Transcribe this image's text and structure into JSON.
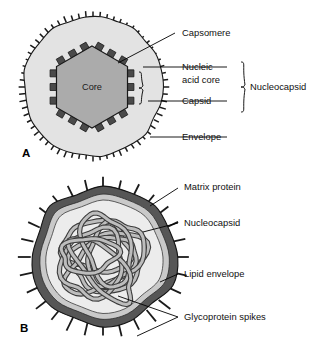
{
  "figure": {
    "panels": [
      {
        "letter": "A",
        "name": "icosahedral-enveloped-virus",
        "core_label": "Core",
        "labels": [
          {
            "key": "capsomere",
            "text": "Capsomere"
          },
          {
            "key": "nucleic_acid_core_line1",
            "text": "Nucleic"
          },
          {
            "key": "nucleic_acid_core_line2",
            "text": "acid core"
          },
          {
            "key": "capsid",
            "text": "Capsid"
          },
          {
            "key": "nucleocapsid",
            "text": "Nucleocapsid"
          },
          {
            "key": "envelope",
            "text": "Envelope"
          }
        ]
      },
      {
        "letter": "B",
        "name": "helical-enveloped-virus",
        "labels": [
          {
            "key": "matrix_protein",
            "text": "Matrix protein"
          },
          {
            "key": "nucleocapsid",
            "text": "Nucleocapsid"
          },
          {
            "key": "lipid_envelope",
            "text": "Lipid envelope"
          },
          {
            "key": "glycoprotein_spikes",
            "text": "Glycoprotein spikes"
          }
        ]
      }
    ]
  },
  "colors": {
    "envelope_fill": "#e3e3e3",
    "core_fill": "#ababab",
    "capsomere_fill": "#4a4a4a",
    "outline": "#1a1a1a",
    "b_outer_band": "#565656",
    "b_mid_band": "#c9c9c9",
    "b_inner_fill": "#ececec",
    "filament_fill": "#bdbdbd",
    "filament_stroke": "#3c3c3c",
    "background": "#ffffff",
    "text": "#111111"
  },
  "panelA": {
    "envelope_center": {
      "x": 93,
      "y": 87
    },
    "envelope_radius": 69,
    "spike_count": 64,
    "hexagon_center": {
      "x": 92,
      "y": 87
    },
    "hexagon_radius": 41,
    "capsomere_count": 18
  },
  "panelB": {
    "center": {
      "x": 103,
      "y": 257
    },
    "radius": 72,
    "spike_count": 28
  }
}
